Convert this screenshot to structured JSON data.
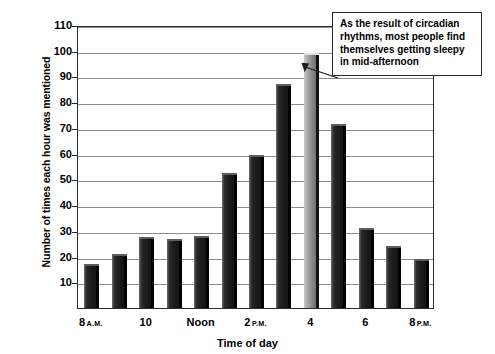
{
  "chart_data": {
    "type": "bar",
    "title": "",
    "xlabel": "Time of day",
    "ylabel": "Number of times each hour was mentioned",
    "ylim": [
      0,
      110
    ],
    "yticks": [
      10,
      20,
      30,
      40,
      50,
      60,
      70,
      80,
      90,
      100,
      110
    ],
    "grid": true,
    "legend": false,
    "categories": [
      "8 A.M.",
      "9",
      "10",
      "11",
      "Noon",
      "1",
      "2 P.M.",
      "3",
      "4",
      "5",
      "6",
      "7",
      "8 P.M."
    ],
    "tick_labels": [
      {
        "index": 0,
        "text": "8",
        "suffix": "A.M."
      },
      {
        "index": 2,
        "text": "10",
        "suffix": ""
      },
      {
        "index": 4,
        "text": "Noon",
        "suffix": ""
      },
      {
        "index": 6,
        "text": "2",
        "suffix": "P.M."
      },
      {
        "index": 8,
        "text": "4",
        "suffix": ""
      },
      {
        "index": 10,
        "text": "6",
        "suffix": ""
      },
      {
        "index": 12,
        "text": "8",
        "suffix": "P.M."
      }
    ],
    "values": [
      17,
      21,
      27.5,
      27,
      28,
      52.5,
      59.5,
      87,
      99,
      71.5,
      31,
      24,
      19
    ],
    "highlight_index": 8,
    "annotations": [
      {
        "text": "As the result of circadian rhythms, most people find themselves getting sleepy in mid-afternoon",
        "points_to_index": 8
      }
    ],
    "colors": {
      "bar_dark": "#211f1f",
      "bar_highlight": "#a9a9a9",
      "gridline": "#8c8c8c",
      "axis": "#2b2b2b",
      "background": "#ffffff",
      "text": "#000000"
    }
  }
}
